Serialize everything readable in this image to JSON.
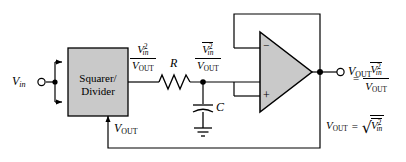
{
  "figure": {
    "type": "circuit-schematic"
  },
  "colors": {
    "wire": "#000000",
    "block_fill": "#c9c9c9",
    "block_stroke": "#000000",
    "background": "#ffffff"
  },
  "blocks": {
    "squarer_divider": {
      "line1": "Squarer/",
      "line2": "Divider"
    },
    "opamp": {
      "inverting_label": "−",
      "noninverting_label": "+"
    }
  },
  "labels": {
    "vin": {
      "v": "V",
      "sub": "in"
    },
    "resistor": "R",
    "capacitor": "C",
    "vout_feedback": {
      "v": "V",
      "sub": "OUT"
    },
    "vout_terminal": {
      "v": "V",
      "sub": "OUT"
    }
  },
  "expressions": {
    "squarer_output": {
      "numerator": {
        "v": "V",
        "sub": "in",
        "sup": "2",
        "overbar": false
      },
      "denominator": {
        "v": "V",
        "sub": "OUT"
      }
    },
    "filter_output": {
      "numerator": {
        "v": "V",
        "sub": "in",
        "sup": "2",
        "overbar": true
      },
      "denominator": {
        "v": "V",
        "sub": "OUT"
      }
    }
  },
  "equations": {
    "eq1": {
      "lhs": {
        "v": "V",
        "sub": "OUT"
      },
      "op": "=",
      "rhs_numerator": {
        "v": "V",
        "sub": "in",
        "sup": "2",
        "overbar": true
      },
      "rhs_denominator": {
        "v": "V",
        "sub": "OUT"
      }
    },
    "eq2": {
      "lhs": {
        "v": "V",
        "sub": "OUT"
      },
      "op": "=",
      "radicand": {
        "v": "V",
        "sub": "in",
        "sup": "2",
        "overbar": true
      }
    }
  },
  "nodes": {
    "vin_terminal": "open-circle-terminal",
    "vout_terminal": "open-circle-terminal",
    "junction_dots": 3,
    "ground": "ground-symbol"
  }
}
